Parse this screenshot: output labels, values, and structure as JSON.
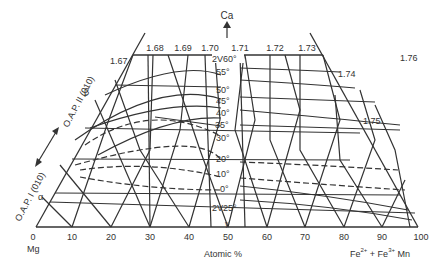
{
  "diagram": {
    "apex_label": "Ca",
    "corner_left_label": "Mg",
    "corner_right_label_parts": [
      "Fe",
      "2+",
      " + Fe",
      "3+",
      " Mn"
    ],
    "x_axis_label": "Atomic %",
    "x_ticks": [
      "0",
      "10",
      "20",
      "30",
      "40",
      "50",
      "60",
      "70",
      "80",
      "90",
      "100"
    ],
    "top_index_labels": [
      "1.68",
      "1.69",
      "1.70",
      "1.71",
      "1.72",
      "1.73"
    ],
    "edge_index_labels": [
      "1.67",
      "1.74",
      "1.75",
      "1.76"
    ],
    "angle_labels": [
      "2V60°",
      "55°",
      "50°",
      "45°",
      "40°",
      "35°",
      "30°",
      "20°",
      "10°",
      "0°",
      "2V25°"
    ],
    "left_axis_labels": {
      "upper": "O.A.P. II (010)",
      "lower": "O.A.P. I (010)",
      "beta": "β",
      "alpha": "α",
      "gamma": "γ"
    }
  }
}
